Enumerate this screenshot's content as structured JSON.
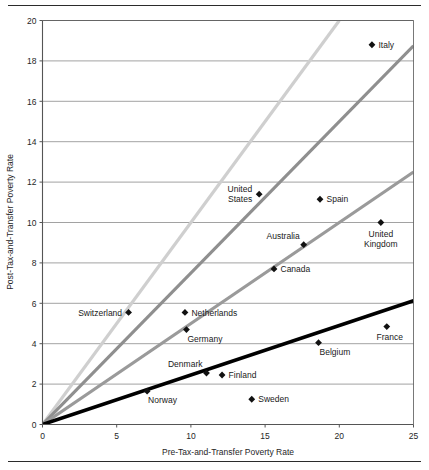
{
  "chart_data": {
    "type": "scatter",
    "title": "",
    "subtitle": "",
    "xlabel": "Pre-Tax-and-Transfer Poverty Rate",
    "ylabel": "Post-Tax-and-Transfer Poverty Rate",
    "xlim": [
      0,
      25
    ],
    "ylim": [
      0,
      20
    ],
    "xticks": [
      0,
      5,
      10,
      15,
      20,
      25
    ],
    "yticks": [
      0,
      2,
      4,
      6,
      8,
      10,
      12,
      14,
      16,
      18,
      20
    ],
    "grid": "horizontal",
    "legend": "none",
    "marker": "diamond",
    "marker_color": "#111111",
    "points": [
      {
        "label": "Italy",
        "x": 22.2,
        "y": 18.8,
        "label_pos": "right"
      },
      {
        "label": "United States",
        "x": 14.6,
        "y": 11.4,
        "label_pos": "left-2line"
      },
      {
        "label": "Spain",
        "x": 18.7,
        "y": 11.15,
        "label_pos": "right"
      },
      {
        "label": "United Kingdom",
        "x": 22.8,
        "y": 10.0,
        "label_pos": "below-2line"
      },
      {
        "label": "Australia",
        "x": 17.6,
        "y": 8.9,
        "label_pos": "above-left"
      },
      {
        "label": "Canada",
        "x": 15.6,
        "y": 7.7,
        "label_pos": "right"
      },
      {
        "label": "Switzerland",
        "x": 5.8,
        "y": 5.55,
        "label_pos": "left"
      },
      {
        "label": "Netherlands",
        "x": 9.6,
        "y": 5.55,
        "label_pos": "right"
      },
      {
        "label": "Germany",
        "x": 9.7,
        "y": 4.7,
        "label_pos": "below-right"
      },
      {
        "label": "France",
        "x": 23.2,
        "y": 4.85,
        "label_pos": "below"
      },
      {
        "label": "Belgium",
        "x": 18.6,
        "y": 4.05,
        "label_pos": "below-right"
      },
      {
        "label": "Denmark",
        "x": 11.05,
        "y": 2.55,
        "label_pos": "above-left"
      },
      {
        "label": "Finland",
        "x": 12.1,
        "y": 2.45,
        "label_pos": "right"
      },
      {
        "label": "Norway",
        "x": 7.05,
        "y": 1.65,
        "label_pos": "below-right"
      },
      {
        "label": "Sweden",
        "x": 14.1,
        "y": 1.25,
        "label_pos": "right"
      }
    ],
    "reference_lines": [
      {
        "name": "line-1-to-1",
        "slope": 1.0,
        "color": "#cfcfcf",
        "width": 3.2
      },
      {
        "name": "line-0-75",
        "slope": 0.75,
        "color": "#8f8f8f",
        "width": 3.2
      },
      {
        "name": "line-0-50",
        "slope": 0.5,
        "color": "#9a9a9a",
        "width": 3.2
      },
      {
        "name": "line-0-25",
        "slope": 0.245,
        "color": "#000000",
        "width": 3.6
      }
    ]
  },
  "axis": {
    "xlabel": "Pre-Tax-and-Transfer Poverty Rate",
    "ylabel": "Post-Tax-and-Transfer Poverty Rate"
  },
  "colors": {
    "axis": "#555555",
    "grid": "#8a8a8a",
    "marker": "#111111",
    "rule": "#2b2b2b"
  }
}
